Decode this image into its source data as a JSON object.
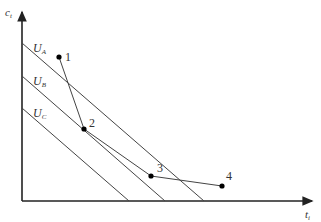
{
  "diagram": {
    "axes": {
      "y_label": "c",
      "y_sub": "t",
      "x_label": "t",
      "x_sub": "i"
    },
    "curves": [
      {
        "label": "U",
        "sub": "A"
      },
      {
        "label": "U",
        "sub": "B"
      },
      {
        "label": "U",
        "sub": "C"
      }
    ],
    "points": [
      {
        "label": "1"
      },
      {
        "label": "2"
      },
      {
        "label": "3"
      },
      {
        "label": "4"
      }
    ],
    "colors": {
      "line": "#444444",
      "axis": "#222222",
      "point": "#000000"
    }
  }
}
